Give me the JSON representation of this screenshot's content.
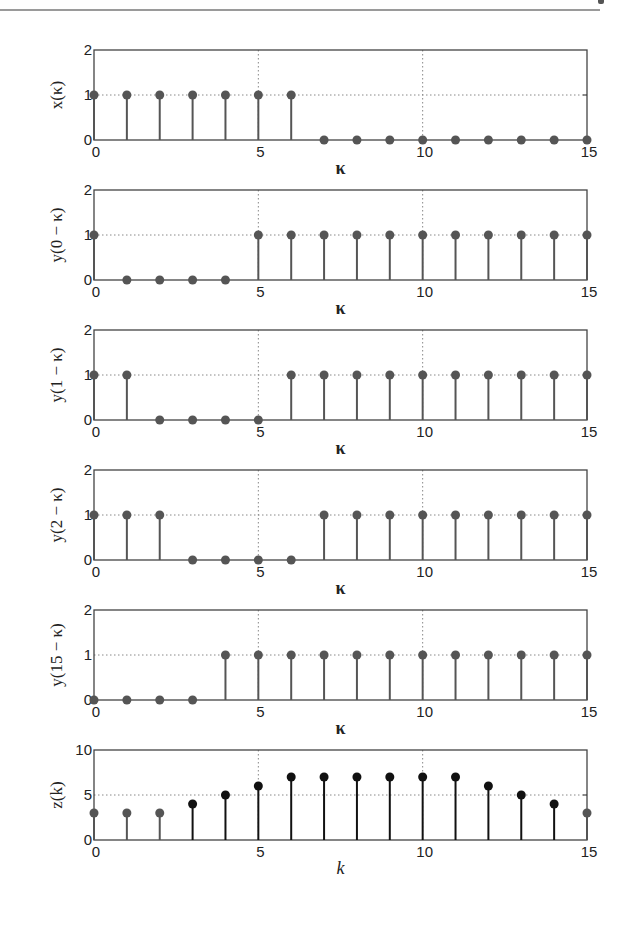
{
  "chart_data": [
    {
      "type": "stem",
      "ylabel": "x(κ)",
      "xlabel": "κ",
      "xlim": [
        0,
        15
      ],
      "ylim": [
        0,
        2
      ],
      "yticks": [
        0,
        1,
        2
      ],
      "xticks": [
        0,
        5,
        10,
        15
      ],
      "grid": true,
      "x": [
        0,
        1,
        2,
        3,
        4,
        5,
        6,
        7,
        8,
        9,
        10,
        11,
        12,
        13,
        14,
        15
      ],
      "values": [
        1,
        1,
        1,
        1,
        1,
        1,
        1,
        0,
        0,
        0,
        0,
        0,
        0,
        0,
        0,
        0
      ]
    },
    {
      "type": "stem",
      "ylabel": "y(0 − κ)",
      "xlabel": "κ",
      "xlim": [
        0,
        15
      ],
      "ylim": [
        0,
        2
      ],
      "yticks": [
        0,
        1,
        2
      ],
      "xticks": [
        0,
        5,
        10,
        15
      ],
      "grid": true,
      "x": [
        0,
        1,
        2,
        3,
        4,
        5,
        6,
        7,
        8,
        9,
        10,
        11,
        12,
        13,
        14,
        15
      ],
      "values": [
        1,
        0,
        0,
        0,
        0,
        1,
        1,
        1,
        1,
        1,
        1,
        1,
        1,
        1,
        1,
        1
      ]
    },
    {
      "type": "stem",
      "ylabel": "y(1 − κ)",
      "xlabel": "κ",
      "xlim": [
        0,
        15
      ],
      "ylim": [
        0,
        2
      ],
      "yticks": [
        0,
        1,
        2
      ],
      "xticks": [
        0,
        5,
        10,
        15
      ],
      "grid": true,
      "x": [
        0,
        1,
        2,
        3,
        4,
        5,
        6,
        7,
        8,
        9,
        10,
        11,
        12,
        13,
        14,
        15
      ],
      "values": [
        1,
        1,
        0,
        0,
        0,
        0,
        1,
        1,
        1,
        1,
        1,
        1,
        1,
        1,
        1,
        1
      ]
    },
    {
      "type": "stem",
      "ylabel": "y(2 − κ)",
      "xlabel": "κ",
      "xlim": [
        0,
        15
      ],
      "ylim": [
        0,
        2
      ],
      "yticks": [
        0,
        1,
        2
      ],
      "xticks": [
        0,
        5,
        10,
        15
      ],
      "grid": true,
      "x": [
        0,
        1,
        2,
        3,
        4,
        5,
        6,
        7,
        8,
        9,
        10,
        11,
        12,
        13,
        14,
        15
      ],
      "values": [
        1,
        1,
        1,
        0,
        0,
        0,
        0,
        1,
        1,
        1,
        1,
        1,
        1,
        1,
        1,
        1
      ]
    },
    {
      "type": "stem",
      "ylabel": "y(15 − κ)",
      "xlabel": "κ",
      "xlim": [
        0,
        15
      ],
      "ylim": [
        0,
        2
      ],
      "yticks": [
        0,
        1,
        2
      ],
      "xticks": [
        0,
        5,
        10,
        15
      ],
      "grid": true,
      "x": [
        0,
        1,
        2,
        3,
        4,
        5,
        6,
        7,
        8,
        9,
        10,
        11,
        12,
        13,
        14,
        15
      ],
      "values": [
        0,
        0,
        0,
        0,
        1,
        1,
        1,
        1,
        1,
        1,
        1,
        1,
        1,
        1,
        1,
        1
      ]
    },
    {
      "type": "stem",
      "ylabel": "z(k)",
      "xlabel": "k",
      "xlim": [
        0,
        15
      ],
      "ylim": [
        0,
        10
      ],
      "yticks": [
        0,
        5,
        10
      ],
      "xticks": [
        0,
        5,
        10,
        15
      ],
      "grid": true,
      "x": [
        0,
        1,
        2,
        3,
        4,
        5,
        6,
        7,
        8,
        9,
        10,
        11,
        12,
        13,
        14,
        15
      ],
      "values": [
        3,
        3,
        3,
        4,
        5,
        6,
        7,
        7,
        7,
        7,
        7,
        7,
        6,
        5,
        4,
        3
      ],
      "highlight": [
        false,
        false,
        false,
        true,
        true,
        true,
        true,
        true,
        true,
        true,
        true,
        true,
        true,
        true,
        true,
        false
      ]
    }
  ],
  "colors": {
    "stem": "#555555",
    "stem_highlight": "#111111",
    "axis": "#444444",
    "grid": "#888888"
  },
  "layout": {
    "left": 94,
    "right": 587,
    "panel_tops": [
      50,
      190,
      330,
      470,
      610,
      750
    ],
    "panel_height": 90
  }
}
